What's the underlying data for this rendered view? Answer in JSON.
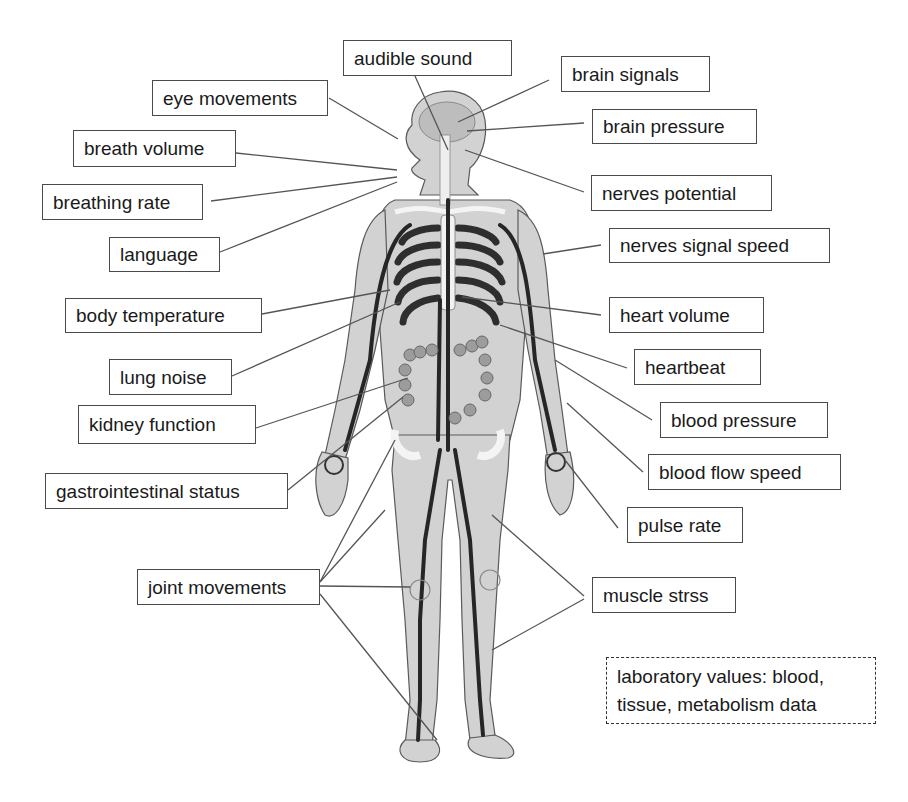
{
  "diagram": {
    "labels_left": [
      {
        "id": "eye-movements",
        "text": "eye movements"
      },
      {
        "id": "breath-volume",
        "text": "breath volume"
      },
      {
        "id": "breathing-rate",
        "text": "breathing rate"
      },
      {
        "id": "language",
        "text": "language"
      },
      {
        "id": "body-temperature",
        "text": "body temperature"
      },
      {
        "id": "lung-noise",
        "text": "lung noise"
      },
      {
        "id": "kidney-function",
        "text": "kidney function"
      },
      {
        "id": "gastrointestinal-status",
        "text": "gastrointestinal status"
      },
      {
        "id": "joint-movements",
        "text": "joint movements"
      }
    ],
    "labels_top": [
      {
        "id": "audible-sound",
        "text": "audible sound"
      }
    ],
    "labels_right": [
      {
        "id": "brain-signals",
        "text": "brain signals"
      },
      {
        "id": "brain-pressure",
        "text": "brain pressure"
      },
      {
        "id": "nerves-potential",
        "text": "nerves potential"
      },
      {
        "id": "nerves-signal-speed",
        "text": "nerves signal speed"
      },
      {
        "id": "heart-volume",
        "text": "heart volume"
      },
      {
        "id": "heartbeat",
        "text": "heartbeat"
      },
      {
        "id": "blood-pressure",
        "text": "blood pressure"
      },
      {
        "id": "blood-flow-speed",
        "text": "blood flow speed"
      },
      {
        "id": "pulse-rate",
        "text": "pulse rate"
      },
      {
        "id": "muscle-stress",
        "text": "muscle strss"
      }
    ],
    "note_box": {
      "line1": "laboratory values: blood,",
      "line2": "tissue, metabolism data"
    },
    "colors": {
      "label_border": "#4a4a4a",
      "leader_line": "#555555",
      "body_fill": "#cfcfcf",
      "vessel": "#2a2a2a",
      "bone": "#f4f4f4"
    }
  }
}
